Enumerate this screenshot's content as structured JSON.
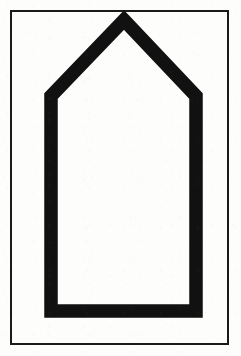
{
  "figure": {
    "title": "Pentagon house-shape outline inside rectangular border",
    "background_color": "#fdfdfc",
    "ink_color": "#111111",
    "canvas": {
      "width": 241,
      "height": 356
    }
  },
  "frame": {
    "name": "outer-rectangle-border",
    "stroke_color": "#1a1a1a",
    "stroke_width": 1.4,
    "fill": "none",
    "x": 11,
    "y": 11,
    "width": 217,
    "height": 333
  },
  "pentagon": {
    "name": "house-pentagon-outline",
    "stroke_color": "#111111",
    "stroke_width": 13.5,
    "fill": "none",
    "linejoin": "miter",
    "vertices": [
      {
        "label": "apex-top",
        "x": 124,
        "y": 20
      },
      {
        "label": "shoulder-right",
        "x": 196,
        "y": 96
      },
      {
        "label": "base-right",
        "x": 196,
        "y": 311
      },
      {
        "label": "base-left",
        "x": 51,
        "y": 311
      },
      {
        "label": "shoulder-left",
        "x": 51,
        "y": 96
      }
    ],
    "path": "M 124 20 L 196 96 L 196 311 L 51 311 L 51 96 Z"
  },
  "geometry_notes": {
    "shape_type": "pentagon",
    "sides": 5,
    "symmetry": "vertical-mirror",
    "apex_position": "top-center",
    "roof_height_px": 76,
    "body_height_px": 215,
    "body_width_px": 145
  }
}
